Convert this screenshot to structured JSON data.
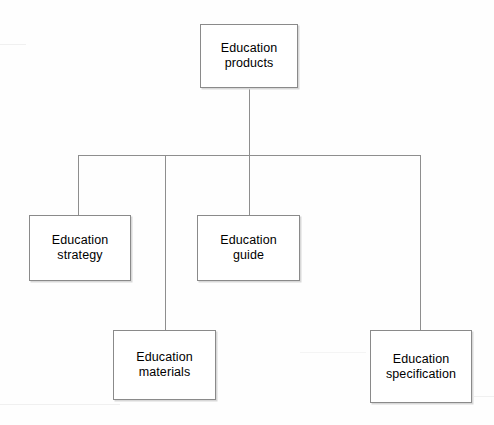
{
  "diagram": {
    "type": "organizational-hierarchy",
    "style": {
      "background_color": "#fefefe",
      "box_fill": "#ffffff",
      "box_border_color": "#8a8a8a",
      "connector_color": "#8e8e8e",
      "text_color": "#000000"
    },
    "nodes": [
      {
        "id": "root",
        "label": "Education\nproducts",
        "line1": "Education",
        "line2": "products",
        "level": 0,
        "x": 200,
        "y": 24,
        "width": 98,
        "height": 64
      },
      {
        "id": "strategy",
        "label": "Education\nstrategy",
        "line1": "Education",
        "line2": "strategy",
        "level": 1,
        "x": 29,
        "y": 215,
        "width": 102,
        "height": 66
      },
      {
        "id": "guide",
        "label": "Education\nguide",
        "line1": "Education",
        "line2": "guide",
        "level": 1,
        "x": 197,
        "y": 215,
        "width": 103,
        "height": 66
      },
      {
        "id": "materials",
        "label": "Education\nmaterials",
        "line1": "Education",
        "line2": "materials",
        "level": 1,
        "x": 113,
        "y": 330,
        "width": 103,
        "height": 70
      },
      {
        "id": "specification",
        "label": "Education\nspecification",
        "line1": "Education",
        "line2": "specification",
        "level": 1,
        "x": 370,
        "y": 330,
        "width": 102,
        "height": 73
      }
    ],
    "connectors": {
      "root_stem": {
        "x": 249,
        "y_start": 88,
        "y_end": 155
      },
      "bus": {
        "y": 155,
        "x_start": 78,
        "x_end": 420
      },
      "drops": [
        {
          "to": "strategy",
          "x": 78,
          "y_start": 155,
          "y_end": 215
        },
        {
          "to": "materials",
          "x": 165,
          "y_start": 155,
          "y_end": 330
        },
        {
          "to": "guide",
          "x": 249,
          "y_start": 155,
          "y_end": 215
        },
        {
          "to": "specification",
          "x": 420,
          "y_start": 155,
          "y_end": 330
        }
      ]
    },
    "edges": [
      {
        "from": "root",
        "to": "strategy"
      },
      {
        "from": "root",
        "to": "guide"
      },
      {
        "from": "root",
        "to": "materials"
      },
      {
        "from": "root",
        "to": "specification"
      }
    ]
  }
}
